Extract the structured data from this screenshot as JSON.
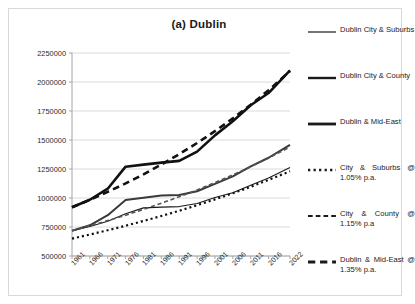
{
  "chart_data": {
    "type": "line",
    "title": "(a)  Dublin",
    "xlabel": "",
    "ylabel": "",
    "ylim": [
      500000,
      2250000
    ],
    "ytick_step": 250000,
    "ytick_labels": [
      "2250000",
      "2000000",
      "1750000",
      "1500000",
      "1250000",
      "1000000",
      "750000",
      "500000"
    ],
    "ytick_values": [
      2250000,
      2000000,
      1750000,
      1500000,
      1250000,
      1000000,
      750000,
      500000
    ],
    "grid": true,
    "legend_position": "right",
    "categories": [
      "1961",
      "1966",
      "1971",
      "1976",
      "1981",
      "1986",
      "1991",
      "1996",
      "2001",
      "2006",
      "2011",
      "2016",
      "2022"
    ],
    "x": [
      1961,
      1966,
      1971,
      1976,
      1981,
      1986,
      1991,
      1996,
      2001,
      2006,
      2011,
      2016,
      2022
    ],
    "series": [
      {
        "name": "Dublin City & Suburbs",
        "style": "solid",
        "width": 1.1,
        "color": "#1a1a1a",
        "values": [
          718000,
          755000,
          800000,
          865000,
          915000,
          921000,
          926000,
          953000,
          1004000,
          1045000,
          1110000,
          1173000,
          1263000
        ]
      },
      {
        "name": "Dublin City & County",
        "style": "solid",
        "width": 2.0,
        "color": "#3a3a3a",
        "values": [
          718000,
          765000,
          852000,
          983000,
          1003000,
          1021000,
          1025000,
          1058000,
          1122000,
          1187000,
          1273000,
          1347000,
          1458000
        ]
      },
      {
        "name": "Dublin & Mid-East",
        "style": "solid",
        "width": 2.6,
        "color": "#111111",
        "values": [
          920000,
          985000,
          1080000,
          1270000,
          1288000,
          1305000,
          1320000,
          1400000,
          1540000,
          1662000,
          1800000,
          1905000,
          2100000
        ]
      },
      {
        "name": "City & Suburbs @ 1.05% p.a.",
        "style": "dotted",
        "width": 2.2,
        "color": "#111111",
        "values": [
          650000,
          685000,
          722000,
          761000,
          802000,
          845000,
          890000,
          938000,
          988000,
          1041000,
          1097000,
          1156000,
          1230000
        ]
      },
      {
        "name": "City & County @ 1.15% p.a",
        "style": "dashed",
        "width": 1.6,
        "color": "#555555",
        "values": [
          718000,
          760000,
          805000,
          852000,
          902000,
          955000,
          1011000,
          1070000,
          1133000,
          1199000,
          1269000,
          1344000,
          1440000
        ]
      },
      {
        "name": "Dublin & Mid-East @ 1.35% p.a.",
        "style": "dashed",
        "width": 2.6,
        "color": "#111111",
        "values": [
          920000,
          984000,
          1053000,
          1126000,
          1204000,
          1288000,
          1378000,
          1474000,
          1576000,
          1686000,
          1804000,
          1929000,
          2095000
        ]
      }
    ]
  },
  "legend": {
    "items": [
      {
        "label": "Dublin City & Suburbs",
        "style": "solid",
        "width": 1.2
      },
      {
        "label": "Dublin City & County",
        "style": "solid",
        "width": 2.4
      },
      {
        "label": "Dublin & Mid-East",
        "style": "solid",
        "width": 2.8
      },
      {
        "label": "City & Suburbs @ 1.05% p.a.",
        "style": "dotted",
        "width": 2.4
      },
      {
        "label": "City & County @ 1.15% p.a",
        "style": "dashed",
        "width": 1.8
      },
      {
        "label": "Dublin & Mid-East @ 1.35% p.a.",
        "style": "dashed",
        "width": 2.8
      }
    ]
  },
  "colors": {
    "frame_border": "#d9d9d9",
    "gridline": "#d0d0d0",
    "axis": "#a6a6a6",
    "text": "#1a1a1a",
    "background": "#ffffff"
  }
}
